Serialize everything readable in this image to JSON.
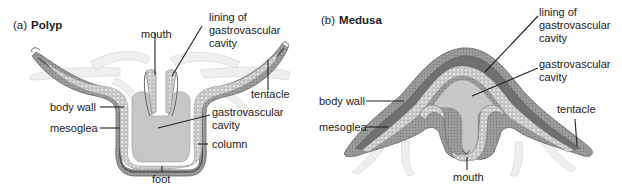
{
  "figure": {
    "panels": [
      {
        "tag": "(a)",
        "title": "Polyp",
        "labels": {
          "mouth": "mouth",
          "lining_line1": "lining of",
          "lining_line2": "gastrovascular",
          "lining_line3": "cavity",
          "tentacle": "tentacle",
          "body_wall": "body wall",
          "gv_line1": "gastrovascular",
          "gv_line2": "cavity",
          "mesoglea": "mesoglea",
          "column": "column",
          "foot": "foot"
        }
      },
      {
        "tag": "(b)",
        "title": "Medusa",
        "labels": {
          "lining_line1": "lining of",
          "lining_line2": "gastrovascular",
          "lining_line3": "cavity",
          "gv_line1": "gastrovascular",
          "gv_line2": "cavity",
          "body_wall": "body wall",
          "tentacle": "tentacle",
          "mesoglea": "mesoglea",
          "mouth": "mouth"
        }
      }
    ],
    "colors": {
      "epidermis": "#9a9a9a",
      "mesoglea": "#6e6e6e",
      "gastrodermis": "#d4d4d4",
      "cavity": "#c4c4c4",
      "ghost_tentacle": "#ececec",
      "leader": "#222222"
    }
  }
}
